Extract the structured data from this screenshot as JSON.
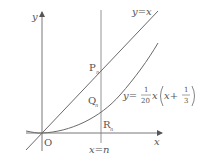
{
  "diagram": {
    "axes": {
      "x_label": "x",
      "y_label": "y",
      "origin_label": "O"
    },
    "lines": {
      "line_label": "y=x",
      "vertical_label": "x=n"
    },
    "curve": {
      "label_prefix": "y=",
      "frac1_num": "1",
      "frac1_den": "20",
      "mid": "x",
      "inner": "x+",
      "frac2_num": "1",
      "frac2_den": "3"
    },
    "points": {
      "P": "P",
      "P_sub": "n",
      "Q": "Q",
      "Q_sub": "n",
      "R": "R",
      "R_sub": "n"
    },
    "colors": {
      "stroke": "#6a6a6a",
      "text": "#555555"
    }
  }
}
